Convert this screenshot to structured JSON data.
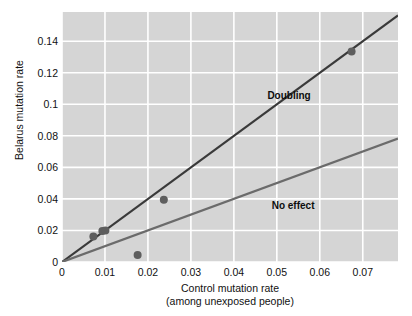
{
  "chart_data": {
    "type": "scatter",
    "title": "",
    "xlabel": "Control mutation rate",
    "xlabel_sub": "(among unexposed people)",
    "ylabel": "Belarus mutation rate",
    "xlim": [
      0,
      0.0782
    ],
    "ylim": [
      0,
      0.1585
    ],
    "xticks": [
      "0",
      "0.01",
      "0.02",
      "0.03",
      "0.04",
      "0.05",
      "0.06",
      "0.07"
    ],
    "xtick_values": [
      0,
      0.01,
      0.02,
      0.03,
      0.04,
      0.05,
      0.06,
      0.07
    ],
    "yticks": [
      "0",
      "0.02",
      "0.04",
      "0.06",
      "0.08",
      "0.1",
      "0.12",
      "0.14"
    ],
    "ytick_values": [
      0,
      0.02,
      0.04,
      0.06,
      0.08,
      0.1,
      0.12,
      0.14
    ],
    "grid": true,
    "grid_color": "#ffffff",
    "plot_background": "#d5d5d5",
    "legend": "none",
    "points": [
      {
        "x": 0.0073,
        "y": 0.0161
      },
      {
        "x": 0.0094,
        "y": 0.0197
      },
      {
        "x": 0.0101,
        "y": 0.0199
      },
      {
        "x": 0.0176,
        "y": 0.0045
      },
      {
        "x": 0.0237,
        "y": 0.0395
      },
      {
        "x": 0.0674,
        "y": 0.1335
      }
    ],
    "point_color": "#5e5e5e",
    "point_radius": 4,
    "series": [
      {
        "name": "Doubling",
        "type": "line",
        "slope": 2,
        "intercept": 0,
        "color": "#3a3a3a",
        "width": 2.2,
        "label_x": 0.0478,
        "label_y": 0.1055
      },
      {
        "name": "No effect",
        "type": "line",
        "slope": 1,
        "intercept": 0,
        "color": "#6b6b6b",
        "width": 2.2,
        "label_x": 0.0488,
        "label_y": 0.0352
      }
    ]
  }
}
